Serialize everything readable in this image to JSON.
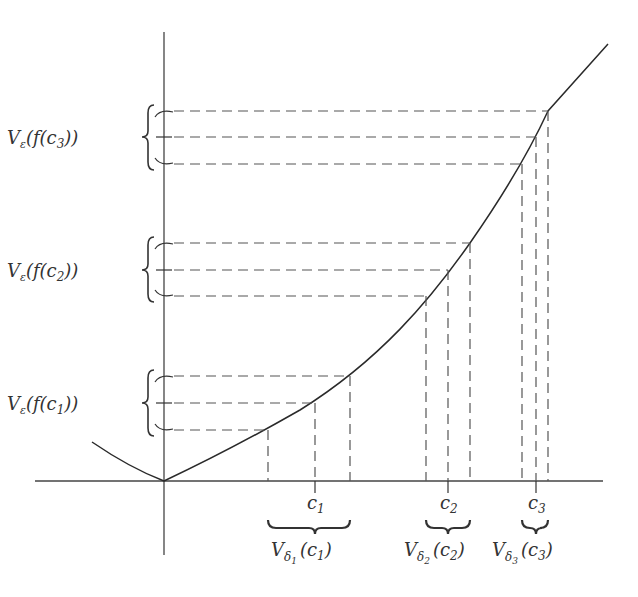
{
  "diagram": {
    "type": "uniform-continuity-illustration",
    "colors": {
      "line": "#2a2a2a",
      "dash": "#555555",
      "text": "#333333",
      "background": "#ffffff"
    },
    "axes": {
      "origin": [
        164,
        481
      ],
      "x_axis": {
        "from": 35,
        "to": 603
      },
      "y_axis": {
        "from": 32,
        "to": 555
      }
    },
    "curve": {
      "description": "convex function f(x) with minimum at origin, increasing steeply to the right",
      "start": [
        92,
        442
      ],
      "vertex": [
        164,
        481
      ],
      "end": [
        608,
        44
      ]
    },
    "points": [
      {
        "name": "c1",
        "label": "c",
        "sub": "1",
        "x_left": 268,
        "x_center": 315,
        "x_right": 350,
        "y_top": 376,
        "y_center": 403,
        "y_bottom": 430,
        "y_label_prefix": "V",
        "y_label_eps": "ε",
        "y_label_body": "(f(c",
        "y_label_close": "))",
        "x_label_prefix": "V",
        "x_label_delta": "δ",
        "x_label_body": "(c",
        "x_label_close": ")"
      },
      {
        "name": "c2",
        "label": "c",
        "sub": "2",
        "x_left": 426,
        "x_center": 448,
        "x_right": 470,
        "y_top": 243,
        "y_center": 270,
        "y_bottom": 296,
        "y_label_prefix": "V",
        "y_label_eps": "ε",
        "y_label_body": "(f(c",
        "y_label_close": "))",
        "x_label_prefix": "V",
        "x_label_delta": "δ",
        "x_label_body": "(c",
        "x_label_close": ")"
      },
      {
        "name": "c3",
        "label": "c",
        "sub": "3",
        "x_left": 522,
        "x_center": 536,
        "x_right": 548,
        "y_top": 111,
        "y_center": 137,
        "y_bottom": 164,
        "y_label_prefix": "V",
        "y_label_eps": "ε",
        "y_label_body": "(f(c",
        "y_label_close": "))",
        "x_label_prefix": "V",
        "x_label_delta": "δ",
        "x_label_body": "(c",
        "x_label_close": ")"
      }
    ],
    "labels": {
      "y_neighborhoods": [
        "Vε(f(c1))",
        "Vε(f(c2))",
        "Vε(f(c3))"
      ],
      "x_neighborhoods": [
        "Vδ1(c1)",
        "Vδ2(c2)",
        "Vδ3(c3)"
      ],
      "x_ticks": [
        "c1",
        "c2",
        "c3"
      ]
    }
  }
}
